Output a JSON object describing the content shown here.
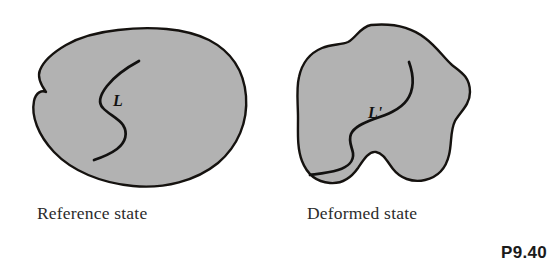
{
  "figure": {
    "problem_number": "P9.40",
    "background_color": "#ffffff",
    "body_fill_color": "#b2b2b2",
    "outline_color": "#15120f",
    "line_color": "#121110",
    "panels": [
      {
        "id": "reference",
        "caption": "Reference state",
        "curve_label": "L",
        "description": "Undeformed continuum body with a material line L"
      },
      {
        "id": "deformed",
        "caption": "Deformed state",
        "curve_label": "L'",
        "description": "Deformed continuum body with the mapped material line L prime"
      }
    ]
  }
}
